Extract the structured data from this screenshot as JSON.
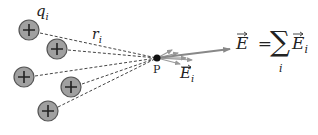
{
  "diagram": {
    "charge_label": "q",
    "charge_subscript": "i",
    "distance_label": "r",
    "distance_subscript": "i",
    "point_label": "P",
    "field_i_label": "E",
    "field_i_subscript": "i",
    "total_field_label": "E",
    "equals": "=",
    "sum_symbol": "∑",
    "sum_index": "i",
    "sum_term": "E",
    "sum_term_subscript": "i",
    "charge_symbol": "+",
    "charges": [
      {
        "cx": 29,
        "cy": 30
      },
      {
        "cx": 57,
        "cy": 49
      },
      {
        "cx": 24,
        "cy": 77
      },
      {
        "cx": 71,
        "cy": 87
      },
      {
        "cx": 48,
        "cy": 111
      }
    ],
    "point": {
      "x": 157,
      "y": 58
    },
    "colors": {
      "charge_fill": "#a0a0a0",
      "charge_stroke": "#555555",
      "line": "#444444",
      "arrow": "#888888",
      "point": "#111111"
    }
  }
}
